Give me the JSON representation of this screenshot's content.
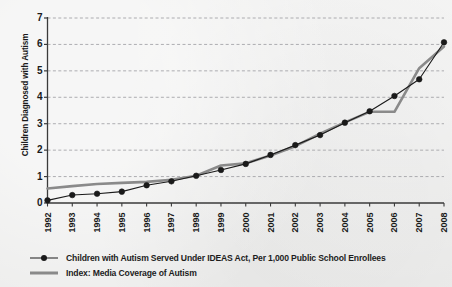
{
  "chart_data": {
    "type": "line",
    "title": "",
    "xlabel": "",
    "ylabel": "Children Diagnosed with Autism",
    "xlim": [
      1992,
      2008
    ],
    "ylim": [
      0,
      7
    ],
    "grid": true,
    "legend_position": "bottom-left",
    "x": [
      1992,
      1993,
      1994,
      1995,
      1996,
      1997,
      1998,
      1999,
      2000,
      2001,
      2002,
      2003,
      2004,
      2005,
      2006,
      2007,
      2008
    ],
    "xtick_labels": [
      "1992",
      "1993",
      "1994",
      "1995",
      "1996",
      "1997",
      "1998",
      "1999",
      "2000",
      "2001",
      "2002",
      "2003",
      "2004",
      "2005",
      "2006",
      "2007",
      "2008"
    ],
    "ytick_labels": [
      "0",
      "1",
      "2",
      "3",
      "4",
      "5",
      "6",
      "7"
    ],
    "ytick_values": [
      0,
      1,
      2,
      3,
      4,
      5,
      6,
      7
    ],
    "series": [
      {
        "name": "Children with Autism Served Under IDEAS Act, Per 1,000 Public School Enrollees",
        "color": "#1a1a1a",
        "marker": "circle",
        "marker_size": 4.6,
        "line_width": 1.1,
        "values": [
          0.1,
          0.3,
          0.35,
          0.43,
          0.67,
          0.82,
          1.03,
          1.25,
          1.48,
          1.82,
          2.19,
          2.57,
          3.04,
          3.47,
          4.05,
          4.68,
          6.08
        ]
      },
      {
        "name": "Index: Media Coverage of Autism",
        "color": "#8a8a8a",
        "marker": "none",
        "marker_size": 0,
        "line_width": 2.6,
        "values": [
          0.55,
          0.64,
          0.72,
          0.76,
          0.8,
          0.88,
          1.03,
          1.42,
          1.5,
          1.8,
          2.15,
          2.62,
          3.05,
          3.45,
          3.45,
          5.1,
          5.92
        ]
      }
    ]
  },
  "legend": {
    "items": [
      {
        "label": "Children with Autism Served Under IDEAS Act, Per 1,000 Public School Enrollees",
        "color": "#1a1a1a",
        "marker": "circle"
      },
      {
        "label": "Index: Media Coverage of Autism",
        "color": "#8a8a8a",
        "marker": "none"
      }
    ]
  },
  "colors": {
    "background": "#ececeb",
    "axis": "#3a3a3a",
    "grid": "#9a9aa0",
    "series_primary": "#1a1a1a",
    "series_secondary": "#8a8a8a",
    "text": "#1a1a1a"
  }
}
